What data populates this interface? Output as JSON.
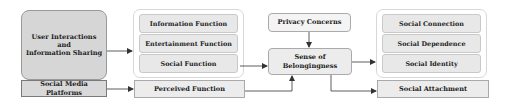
{
  "diagram": {
    "left": {
      "main": "User Interactions\nand\nInformation Sharing",
      "main_lines": [
        "User Interactions",
        "and",
        "Information Sharing"
      ],
      "base": "Social Media Platforms"
    },
    "middle": {
      "items": [
        "Information Function",
        "Entertainment Function",
        "Social Function"
      ],
      "base": "Perceived Function"
    },
    "center": {
      "privacy": "Privacy Concerns",
      "belonging": "Sense of Belongingness"
    },
    "right": {
      "items": [
        "Social Connection",
        "Social Dependence",
        "Social Identity"
      ],
      "base": "Social Attachment"
    },
    "colors": {
      "dark_box": "#d6d6d6",
      "light_box": "#ececec",
      "border": "#9a9a9a",
      "arrow": "#333333"
    }
  }
}
